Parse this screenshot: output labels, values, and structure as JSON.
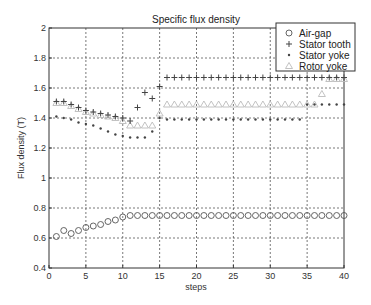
{
  "chart_data": {
    "type": "scatter",
    "title": "Specific flux density",
    "xlabel": "steps",
    "ylabel": "Flux density (T)",
    "xlim": [
      0,
      40
    ],
    "ylim": [
      0.4,
      2.0
    ],
    "xticks": [
      0,
      5,
      10,
      15,
      20,
      25,
      30,
      35,
      40
    ],
    "yticks": [
      0.4,
      0.6,
      0.8,
      1.0,
      1.2,
      1.4,
      1.6,
      1.8,
      2.0
    ],
    "ytick_labels": [
      "0.4",
      "0.6",
      "0.8",
      "1",
      "1.2",
      "1.4",
      "1.6",
      "1.8",
      "2"
    ],
    "grid": true,
    "legend_position": "top-right",
    "x": [
      1,
      2,
      3,
      4,
      5,
      6,
      7,
      8,
      9,
      10,
      11,
      12,
      13,
      14,
      15,
      16,
      17,
      18,
      19,
      20,
      21,
      22,
      23,
      24,
      25,
      26,
      27,
      28,
      29,
      30,
      31,
      32,
      33,
      34,
      35,
      36,
      37,
      38,
      39,
      40
    ],
    "series": [
      {
        "name": "Air-gap",
        "marker": "circle",
        "color": "#555555",
        "values": [
          0.61,
          0.65,
          0.63,
          0.65,
          0.67,
          0.68,
          0.69,
          0.71,
          0.72,
          0.74,
          0.75,
          0.75,
          0.75,
          0.75,
          0.75,
          0.75,
          0.75,
          0.75,
          0.75,
          0.75,
          0.75,
          0.75,
          0.75,
          0.75,
          0.75,
          0.75,
          0.75,
          0.75,
          0.75,
          0.75,
          0.75,
          0.75,
          0.75,
          0.75,
          0.75,
          0.75,
          0.75,
          0.75,
          0.75,
          0.75
        ]
      },
      {
        "name": "Stator tooth",
        "marker": "plus",
        "color": "#444444",
        "values": [
          1.51,
          1.51,
          1.49,
          1.47,
          1.45,
          1.44,
          1.43,
          1.42,
          1.41,
          1.4,
          1.38,
          1.47,
          1.57,
          1.53,
          1.61,
          1.67,
          1.67,
          1.67,
          1.67,
          1.67,
          1.67,
          1.67,
          1.67,
          1.67,
          1.67,
          1.67,
          1.67,
          1.67,
          1.67,
          1.67,
          1.67,
          1.67,
          1.67,
          1.67,
          1.67,
          1.67,
          1.67,
          1.67,
          1.67,
          1.67
        ]
      },
      {
        "name": "Stator yoke",
        "marker": "point",
        "color": "#444444",
        "values": [
          1.41,
          1.4,
          1.39,
          1.37,
          1.36,
          1.35,
          1.33,
          1.31,
          1.29,
          1.28,
          1.27,
          1.27,
          1.27,
          1.31,
          1.4,
          1.39,
          1.39,
          1.39,
          1.39,
          1.39,
          1.39,
          1.39,
          1.39,
          1.39,
          1.39,
          1.39,
          1.39,
          1.39,
          1.39,
          1.39,
          1.39,
          1.39,
          1.39,
          1.39,
          1.49,
          1.49,
          1.49,
          1.49,
          1.49,
          1.49
        ]
      },
      {
        "name": "Rotor yoke",
        "marker": "triangle",
        "color": "#bbbbbb",
        "values": [
          1.5,
          1.5,
          1.48,
          1.46,
          1.44,
          1.43,
          1.42,
          1.41,
          1.4,
          1.38,
          1.35,
          1.35,
          1.35,
          1.35,
          1.43,
          1.49,
          1.49,
          1.49,
          1.49,
          1.49,
          1.49,
          1.49,
          1.49,
          1.49,
          1.49,
          1.49,
          1.49,
          1.49,
          1.49,
          1.49,
          1.49,
          1.49,
          1.49,
          1.49,
          1.49,
          1.49,
          1.56,
          1.66,
          1.66,
          1.66
        ]
      }
    ]
  }
}
